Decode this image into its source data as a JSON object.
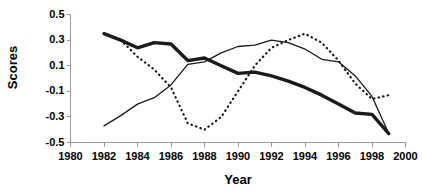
{
  "chart_data": {
    "type": "line",
    "title": "",
    "xlabel": "Year",
    "ylabel": "Scores",
    "xlim": [
      1980,
      2000
    ],
    "ylim": [
      -0.5,
      0.5
    ],
    "xticks": [
      1980,
      1982,
      1984,
      1986,
      1988,
      1990,
      1992,
      1994,
      1996,
      1998,
      2000
    ],
    "yticks": [
      -0.5,
      -0.3,
      -0.1,
      0.1,
      0.3,
      0.5
    ],
    "xtick_labels": [
      "1980",
      "1982",
      "1984",
      "1986",
      "1988",
      "1990",
      "1992",
      "1994",
      "1996",
      "1998",
      "2000"
    ],
    "ytick_labels": [
      "-0.5",
      "-0.3",
      "-0.1",
      "0.1",
      "0.3",
      "0.5"
    ],
    "grid": false,
    "legend": "none",
    "series": [
      {
        "name": "thick-solid-series",
        "style": "solid",
        "width": 3.4,
        "color": "#1a1a1a",
        "x": [
          1982,
          1983,
          1984,
          1985,
          1986,
          1987,
          1988,
          1989,
          1990,
          1991,
          1992,
          1993,
          1994,
          1995,
          1996,
          1997,
          1998,
          1999
        ],
        "y": [
          0.35,
          0.3,
          0.24,
          0.28,
          0.27,
          0.14,
          0.16,
          0.1,
          0.04,
          0.05,
          0.02,
          -0.02,
          -0.07,
          -0.13,
          -0.2,
          -0.27,
          -0.28,
          -0.43
        ]
      },
      {
        "name": "thin-solid-series",
        "style": "solid",
        "width": 1.3,
        "color": "#1a1a1a",
        "x": [
          1982,
          1983,
          1984,
          1985,
          1986,
          1987,
          1988,
          1989,
          1990,
          1991,
          1992,
          1993,
          1994,
          1995,
          1996,
          1997,
          1998,
          1999
        ],
        "y": [
          -0.37,
          -0.29,
          -0.2,
          -0.15,
          -0.05,
          0.11,
          0.13,
          0.2,
          0.25,
          0.26,
          0.3,
          0.28,
          0.23,
          0.15,
          0.13,
          0.02,
          -0.14,
          -0.43
        ]
      },
      {
        "name": "dotted-series",
        "style": "dotted",
        "width": 2.2,
        "color": "#1a1a1a",
        "x": [
          1983,
          1984,
          1985,
          1986,
          1987,
          1988,
          1989,
          1990,
          1991,
          1992,
          1993,
          1994,
          1995,
          1996,
          1997,
          1998,
          1999
        ],
        "y": [
          0.3,
          0.17,
          0.07,
          -0.07,
          -0.35,
          -0.4,
          -0.3,
          -0.1,
          0.1,
          0.24,
          0.3,
          0.35,
          0.28,
          0.14,
          -0.04,
          -0.16,
          -0.13
        ]
      }
    ]
  }
}
